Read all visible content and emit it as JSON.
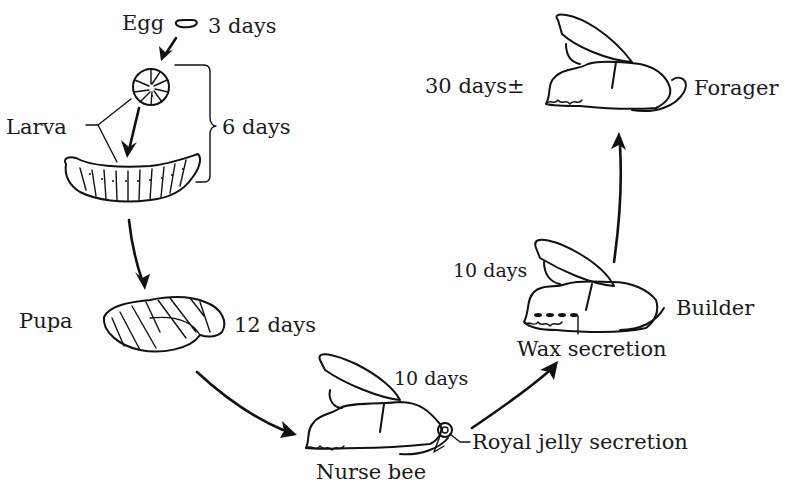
{
  "diagram": {
    "stages": [
      {
        "id": "egg",
        "label": "Egg",
        "duration": "3 days"
      },
      {
        "id": "larva",
        "label": "Larva",
        "duration": "6 days"
      },
      {
        "id": "pupa",
        "label": "Pupa",
        "duration": "12 days"
      },
      {
        "id": "nurse",
        "label": "Nurse bee",
        "duration": "10 days",
        "annotation": "Royal jelly secretion"
      },
      {
        "id": "builder",
        "label": "Builder",
        "duration": "10 days",
        "annotation": "Wax secretion"
      },
      {
        "id": "forager",
        "label": "Forager",
        "duration": "30 days±"
      }
    ],
    "flow": [
      "egg",
      "larva",
      "pupa",
      "nurse",
      "builder",
      "forager"
    ],
    "colors": {
      "ink": "#111111",
      "background": "#fefefe"
    }
  }
}
